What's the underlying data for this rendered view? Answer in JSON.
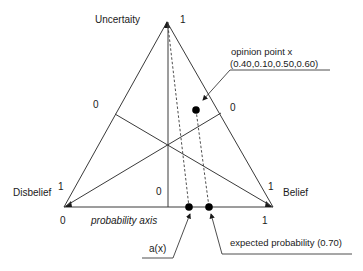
{
  "diagram": {
    "vertices": {
      "uncertainty": {
        "label": "Uncertaity",
        "value": "1"
      },
      "disbelief": {
        "label": "Disbelief",
        "value": "1"
      },
      "belief": {
        "label": "Belief",
        "value": "1"
      }
    },
    "zero_labels": {
      "left_side": "0",
      "right_side": "0",
      "base_center": "0"
    },
    "axis": {
      "label": "probability axis",
      "start": "0",
      "end": "1"
    },
    "opinion_point": {
      "label": "opinion point x",
      "values": "(0.40,0.10,0.50,0.60)"
    },
    "base_rate": {
      "label": "a(x)"
    },
    "expected_probability": {
      "label": "expected probability (0.70)"
    },
    "colors": {
      "line": "#3a3a3a",
      "text": "#1a1a1a",
      "background": "#ffffff"
    }
  }
}
